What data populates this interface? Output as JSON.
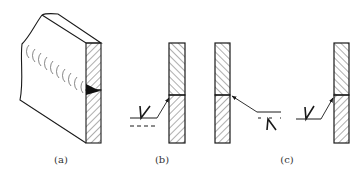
{
  "figure": {
    "colors": {
      "line": "#1a1a1a",
      "hatch": "#333333",
      "weld_fill": "#111111",
      "background": "#ffffff"
    },
    "panels": [
      {
        "id": "a",
        "label": "(a)",
        "content": "isometric plate with weld bead ripples and sectioned edge showing filled weld"
      },
      {
        "id": "b",
        "label": "(b)",
        "content": "sectioned plate, arrow to joint, solid reference line with V symbol above, dashed identification line below"
      },
      {
        "id": "c",
        "label": "(c)",
        "content": "two sectioned plates: left with inverted V below dashed line; right with V on solid reference line"
      }
    ]
  }
}
